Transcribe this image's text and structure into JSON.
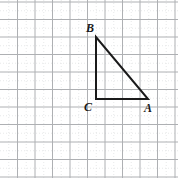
{
  "figure": {
    "type": "geometry-diagram",
    "canvas": {
      "width": 178,
      "height": 178,
      "background": "#ffffff"
    },
    "grid": {
      "visible": true,
      "spacing_px": 17.5,
      "origin_x_px": 17.5,
      "origin_y_px": 2.0,
      "major_color": "#aeb0b3",
      "minor_color": "#d8dadc",
      "major_width_px": 1.0,
      "minor_width_px": 0.6,
      "minor_dash": "1,2",
      "columns": 10,
      "rows": 10
    },
    "shape": {
      "name": "triangle-ABC",
      "kind": "right-triangle",
      "stroke_color": "#1a1a1a",
      "stroke_width_px": 2,
      "fill": "none",
      "right_angle_at": "C",
      "points_px": "96,37 96,99 148,99",
      "vertices": [
        {
          "id": "B",
          "label": "B",
          "x_px": 96,
          "y_px": 37,
          "grid_x": 4.5,
          "grid_y": 2,
          "label_x_px": 86,
          "label_y_px": 22
        },
        {
          "id": "C",
          "label": "C",
          "x_px": 96,
          "y_px": 99,
          "grid_x": 4.5,
          "grid_y": 5.5,
          "label_x_px": 84,
          "label_y_px": 101
        },
        {
          "id": "A",
          "label": "A",
          "x_px": 148,
          "y_px": 99,
          "grid_x": 7.5,
          "grid_y": 5.5,
          "label_x_px": 144,
          "label_y_px": 102
        }
      ],
      "edges": [
        {
          "id": "BC",
          "from": "B",
          "to": "C",
          "orientation": "vertical",
          "length_units": 3.5
        },
        {
          "id": "CA",
          "from": "C",
          "to": "A",
          "orientation": "horizontal",
          "length_units": 3
        },
        {
          "id": "AB",
          "from": "A",
          "to": "B",
          "orientation": "hypotenuse",
          "length_units": 4.61
        }
      ]
    }
  }
}
